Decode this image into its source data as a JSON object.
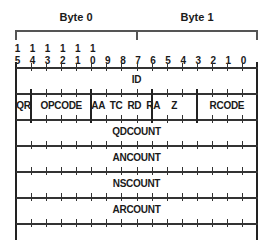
{
  "header": {
    "bytes": [
      {
        "label": "Byte 0"
      },
      {
        "label": "Byte 1"
      }
    ]
  },
  "bit_numbers": {
    "tens_row": [
      "1",
      "1",
      "1",
      "1",
      "1",
      "1",
      "",
      "",
      "",
      "",
      "",
      "",
      "",
      "",
      "",
      ""
    ],
    "units_row": [
      "5",
      "4",
      "3",
      "2",
      "1",
      "0",
      "9",
      "8",
      "7",
      "6",
      "5",
      "4",
      "3",
      "2",
      "1",
      "0"
    ]
  },
  "rows": [
    {
      "fields": [
        {
          "label": "ID",
          "bits": 16
        }
      ]
    },
    {
      "fields": [
        {
          "label": "QR",
          "bits": 1
        },
        {
          "label": "OPCODE",
          "bits": 4
        },
        {
          "label": "AA  TC  RD  RA",
          "bits": 4
        },
        {
          "label": "Z",
          "bits": 3
        },
        {
          "label": "RCODE",
          "bits": 4
        }
      ]
    },
    {
      "fields": [
        {
          "label": "QDCOUNT",
          "bits": 16
        }
      ]
    },
    {
      "fields": [
        {
          "label": "ANCOUNT",
          "bits": 16
        }
      ]
    },
    {
      "fields": [
        {
          "label": "NSCOUNT",
          "bits": 16
        }
      ]
    },
    {
      "fields": [
        {
          "label": "ARCOUNT",
          "bits": 16
        }
      ]
    }
  ],
  "colors": {
    "line": "#333333",
    "text": "#1a1a1a",
    "background": "#ffffff"
  }
}
